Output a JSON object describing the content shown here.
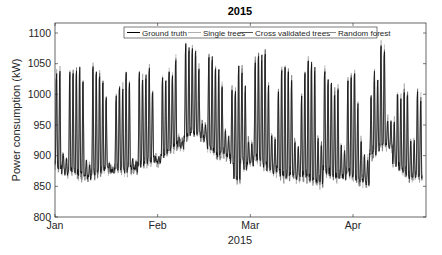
{
  "chart_data": {
    "type": "line",
    "title": "2015",
    "xlabel": "2015",
    "ylabel": "Power consumption (kW)",
    "ylim": [
      800,
      1100
    ],
    "yticks": [
      800,
      850,
      900,
      950,
      1000,
      1050,
      1100
    ],
    "xticks": [
      {
        "label": "Jan",
        "day": 0
      },
      {
        "label": "Feb",
        "day": 31
      },
      {
        "label": "Mar",
        "day": 59
      },
      {
        "label": "Apr",
        "day": 90
      }
    ],
    "xlim_days": [
      0,
      112
    ],
    "grid": false,
    "legend": {
      "position": "top-center",
      "orientation": "horizontal",
      "entries": [
        "Ground truth",
        "Single trees",
        "Cross validated trees",
        "Random forest"
      ]
    },
    "series": [
      {
        "name": "Ground truth",
        "color": "#000000"
      },
      {
        "name": "Single trees",
        "color": "#b0b0b0"
      },
      {
        "name": "Cross validated trees",
        "color": "#555555"
      },
      {
        "name": "Random forest",
        "color": "#8a8a8a"
      }
    ],
    "daily_peaks_kw": [
      1040,
      1045,
      905,
      895,
      1040,
      1045,
      1050,
      1055,
      1030,
      890,
      885,
      1055,
      1045,
      1040,
      1030,
      1000,
      885,
      880,
      1000,
      1020,
      1020,
      1040,
      1030,
      895,
      890,
      1040,
      1030,
      1040,
      1050,
      1010,
      900,
      895,
      1030,
      1030,
      1040,
      1035,
      1060,
      930,
      925,
      1085,
      1080,
      1080,
      1075,
      1050,
      955,
      950,
      1070,
      1065,
      1050,
      1045,
      1020,
      940,
      935,
      1010,
      1015,
      1055,
      1045,
      1020,
      925,
      920,
      1060,
      1075,
      1070,
      1075,
      1020,
      935,
      930,
      1010,
      1050,
      1050,
      1045,
      1030,
      925,
      920,
      1000,
      1040,
      1065,
      1060,
      1050,
      930,
      925,
      1050,
      1030,
      1030,
      1010,
      1020,
      915,
      910,
      1030,
      1040,
      1045,
      990,
      930,
      900,
      895,
      1000,
      1040,
      1025,
      1085,
      1080,
      960,
      955,
      960,
      1010,
      1000,
      1015,
      1010,
      930,
      925,
      1010,
      1000
    ],
    "daily_troughs_kw": [
      885,
      880,
      875,
      872,
      878,
      876,
      874,
      870,
      868,
      866,
      865,
      872,
      870,
      875,
      878,
      880,
      876,
      874,
      882,
      880,
      878,
      876,
      880,
      878,
      876,
      885,
      888,
      890,
      892,
      895,
      893,
      890,
      900,
      905,
      910,
      915,
      920,
      918,
      915,
      930,
      935,
      940,
      938,
      935,
      930,
      928,
      915,
      910,
      905,
      900,
      905,
      902,
      900,
      890,
      865,
      860,
      895,
      880,
      890,
      888,
      900,
      895,
      890,
      885,
      880,
      878,
      875,
      880,
      870,
      865,
      868,
      870,
      866,
      864,
      870,
      868,
      866,
      860,
      862,
      858,
      856,
      880,
      875,
      870,
      868,
      865,
      866,
      864,
      875,
      870,
      865,
      860,
      862,
      858,
      856,
      900,
      905,
      910,
      915,
      920,
      918,
      915,
      890,
      885,
      880,
      875,
      870,
      866,
      864,
      868,
      866
    ]
  }
}
